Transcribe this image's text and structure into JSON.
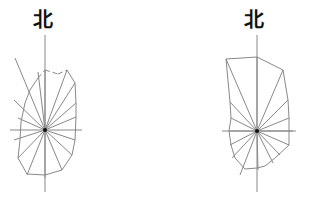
{
  "diagrams": [
    {
      "id": "left",
      "north_label": "北",
      "label_pos": [
        33,
        10
      ],
      "center": [
        45,
        130
      ],
      "axis": {
        "top": 35,
        "bottom": 192,
        "left": 10,
        "right": 82
      },
      "rays": [
        [
          45,
          70
        ],
        [
          67,
          70
        ],
        [
          75,
          83
        ],
        [
          76,
          103
        ],
        [
          76,
          117
        ],
        [
          75,
          140
        ],
        [
          72,
          155
        ],
        [
          62,
          170
        ],
        [
          45,
          178
        ],
        [
          27,
          175
        ],
        [
          18,
          158
        ],
        [
          14,
          140
        ],
        [
          18,
          118
        ],
        [
          14,
          100
        ],
        [
          15,
          58
        ],
        [
          38,
          72
        ]
      ],
      "outline": [
        [
          45,
          70
        ],
        [
          58,
          74
        ],
        [
          67,
          70
        ],
        [
          75,
          83
        ],
        [
          76,
          103
        ],
        [
          76,
          117
        ],
        [
          75,
          140
        ],
        [
          72,
          155
        ],
        [
          62,
          170
        ],
        [
          45,
          175
        ],
        [
          27,
          174
        ],
        [
          18,
          158
        ],
        [
          20,
          140
        ],
        [
          21,
          122
        ],
        [
          25,
          103
        ],
        [
          30,
          90
        ],
        [
          38,
          78
        ]
      ],
      "dashed_segments": [
        [
          [
            38,
            78
          ],
          [
            45,
            70
          ]
        ],
        [
          [
            45,
            70
          ],
          [
            58,
            74
          ]
        ],
        [
          [
            58,
            74
          ],
          [
            67,
            70
          ]
        ]
      ]
    },
    {
      "id": "right",
      "north_label": "北",
      "label_pos": [
        244,
        10
      ],
      "center": [
        257,
        131
      ],
      "axis": {
        "top": 35,
        "bottom": 192,
        "left": 222,
        "right": 296
      },
      "rays": [
        [
          257,
          57
        ],
        [
          283,
          70
        ],
        [
          288,
          100
        ],
        [
          289,
          118
        ],
        [
          293,
          131
        ],
        [
          289,
          145
        ],
        [
          280,
          155
        ],
        [
          273,
          163
        ],
        [
          258,
          170
        ],
        [
          240,
          175
        ],
        [
          232,
          158
        ],
        [
          230,
          145
        ],
        [
          229,
          131
        ],
        [
          231,
          118
        ],
        [
          230,
          102
        ],
        [
          226,
          59
        ]
      ],
      "outline": [
        [
          257,
          57
        ],
        [
          283,
          70
        ],
        [
          288,
          100
        ],
        [
          289,
          118
        ],
        [
          289,
          131
        ],
        [
          289,
          145
        ],
        [
          275,
          158
        ],
        [
          265,
          166
        ],
        [
          257,
          168
        ],
        [
          245,
          169
        ],
        [
          235,
          158
        ],
        [
          231,
          145
        ],
        [
          229,
          131
        ],
        [
          231,
          118
        ],
        [
          230,
          102
        ],
        [
          226,
          59
        ]
      ],
      "dashed_segments": []
    }
  ],
  "colors": {
    "line": "#888888",
    "center": "#111111",
    "text": "#111111"
  }
}
